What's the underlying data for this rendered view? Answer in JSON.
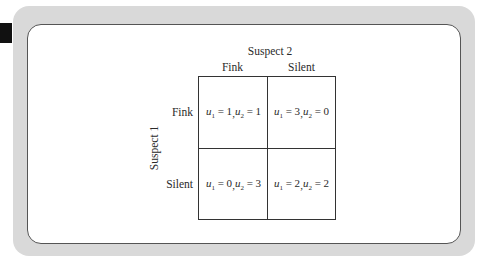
{
  "diagram": {
    "type": "payoff-matrix",
    "player2_label": "Suspect 2",
    "player1_label": "Suspect 1",
    "columns": [
      "Fink",
      "Silent"
    ],
    "rows": [
      "Fink",
      "Silent"
    ],
    "cells": [
      [
        {
          "u1": "1",
          "u2": "1"
        },
        {
          "u1": "3",
          "u2": "0"
        }
      ],
      [
        {
          "u1": "0",
          "u2": "3"
        },
        {
          "u1": "2",
          "u2": "2"
        }
      ]
    ],
    "var_prefix": "u",
    "sub1": "1",
    "sub2": "2",
    "eq": " = ",
    "sep": ", "
  },
  "colors": {
    "frame": "#d9d9d9",
    "panel": "#ffffff",
    "lines": "#333333",
    "tab": "#111111"
  }
}
